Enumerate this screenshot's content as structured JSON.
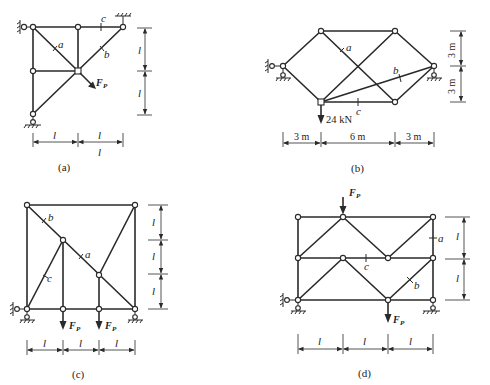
{
  "figures": [
    {
      "id": "a",
      "caption": "(a)",
      "member_labels": {
        "a": "a",
        "b": "b",
        "c": "c"
      },
      "load_label": "F",
      "load_sub": "P",
      "dims_h": [
        "l",
        "l",
        "l"
      ],
      "dims_v": [
        "l",
        "l"
      ]
    },
    {
      "id": "b",
      "caption": "(b)",
      "member_labels": {
        "a": "a",
        "b": "b",
        "c": "c"
      },
      "load_label": "24 kN",
      "dims_h": [
        "3 m",
        "6 m",
        "3 m"
      ],
      "dims_v": [
        "3 m",
        "3 m"
      ]
    },
    {
      "id": "c",
      "caption": "(c)",
      "member_labels": {
        "a": "a",
        "b": "b",
        "c": "c"
      },
      "load_label": "F",
      "load_sub": "P",
      "dims_h": [
        "l",
        "l",
        "l"
      ],
      "dims_v": [
        "l",
        "l",
        "l"
      ]
    },
    {
      "id": "d",
      "caption": "(d)",
      "member_labels": {
        "a": "a",
        "b": "b",
        "c": "c"
      },
      "load_label": "F",
      "load_sub": "P",
      "dims_h": [
        "l",
        "l",
        "l"
      ],
      "dims_v": [
        "l",
        "l"
      ]
    }
  ]
}
